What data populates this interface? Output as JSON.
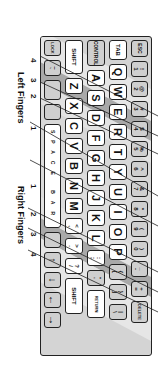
{
  "colors": {
    "frame": "#d4d4d4",
    "zone_light": "#e0e0e0",
    "zone_dark": "#a8a8a8",
    "key_gray": "#cfcfcf",
    "key_white": "#ffffff",
    "line": "#222222"
  },
  "keyboard": {
    "row1": [
      "ESC",
      "1 !",
      "2 @",
      "3 #",
      "4 $",
      "5 %",
      "6 ^",
      "7 &",
      "8 *",
      "9 (",
      "0 )",
      "- _",
      "= +",
      "DELETE"
    ],
    "row2": [
      "TAB",
      "Q",
      "W",
      "E",
      "R",
      "T",
      "Y",
      "U",
      "I",
      "O",
      "P",
      "[ {",
      "] }",
      "\\ |"
    ],
    "row3": [
      "CONTROL",
      "A",
      "S",
      "D",
      "F",
      "G",
      "H",
      "J",
      "K",
      "L",
      "; :",
      "' \"",
      "RETURN"
    ],
    "row4": [
      "SHIFT",
      "Z",
      "X",
      "C",
      "V",
      "B",
      "N",
      "M",
      ", <",
      ". >",
      "/ ?",
      "SHIFT"
    ],
    "row5": [
      "LOCK",
      "` ~",
      "",
      "",
      "SPACE BAR",
      "",
      "↑",
      "↓",
      "←",
      "→"
    ]
  },
  "labels": {
    "left_fingers": "Left Fingers",
    "right_fingers": "Right Fingers",
    "left_numbers": [
      "4",
      "3",
      "2",
      "1"
    ],
    "right_numbers": [
      "1",
      "2",
      "3",
      "4"
    ]
  }
}
